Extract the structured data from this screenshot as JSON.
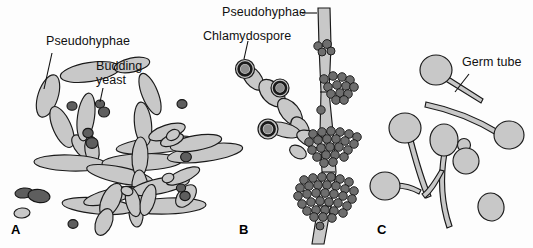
{
  "figure": {
    "background_color": "#fdfdfd",
    "width": 533,
    "height": 248,
    "cell_fill_color": "#c8c8c8",
    "cell_outline_color": "#1a1a1a",
    "dark_cell_fill_color": "#5e5e5e",
    "cluster_cell_fill_color": "#6b6b6b",
    "label_text_color": "#111111"
  },
  "panels": [
    {
      "letter": "A",
      "name": "pseudohyphae-and-budding-yeast",
      "labels": [
        {
          "id": "a-pseudohyphae",
          "text": "Pseudohyphae"
        },
        {
          "id": "a-budding-yeast",
          "line1": "Budding",
          "line2": "yeast"
        }
      ]
    },
    {
      "letter": "B",
      "name": "chlamydospores-on-pseudohyphae",
      "labels": [
        {
          "id": "b-pseudohyphae",
          "text": "Pseudohyphae"
        },
        {
          "id": "b-chlamydospore",
          "text": "Chlamydospore"
        }
      ]
    },
    {
      "letter": "C",
      "name": "germ-tubes",
      "labels": [
        {
          "id": "c-germ-tube",
          "text": "Germ tube"
        }
      ]
    }
  ]
}
